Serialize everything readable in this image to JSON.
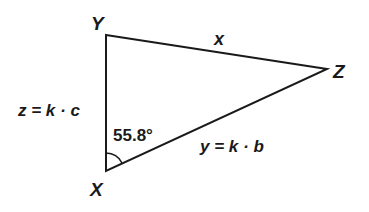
{
  "diagram": {
    "type": "triangle",
    "vertices": {
      "Y": {
        "label": "Y",
        "x": 106,
        "y": 35
      },
      "X": {
        "label": "X",
        "x": 106,
        "y": 171
      },
      "Z": {
        "label": "Z",
        "x": 327,
        "y": 69
      }
    },
    "sides": {
      "YZ": {
        "label": "x"
      },
      "XY": {
        "label": "z = k · c"
      },
      "XZ": {
        "label": "y = k · b"
      }
    },
    "angle_X": {
      "label": "55.8°"
    },
    "stroke_color": "#1a1a1a",
    "background": "#ffffff"
  }
}
